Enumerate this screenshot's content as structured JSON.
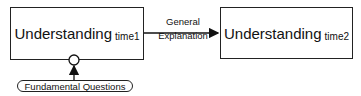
{
  "diagram": {
    "nodes": [
      {
        "id": "understanding_time1",
        "label": "Understanding",
        "subscript": "time1"
      },
      {
        "id": "understanding_time2",
        "label": "Understanding",
        "subscript": "time2"
      }
    ],
    "edges": [
      {
        "from": "understanding_time1",
        "to": "understanding_time2",
        "label_line1": "General",
        "label_line2": "Explanation"
      }
    ],
    "input": {
      "label": "Fundamental Questions",
      "target": "understanding_time1"
    }
  },
  "colors": {
    "stroke": "#222222",
    "background": "#ffffff"
  }
}
